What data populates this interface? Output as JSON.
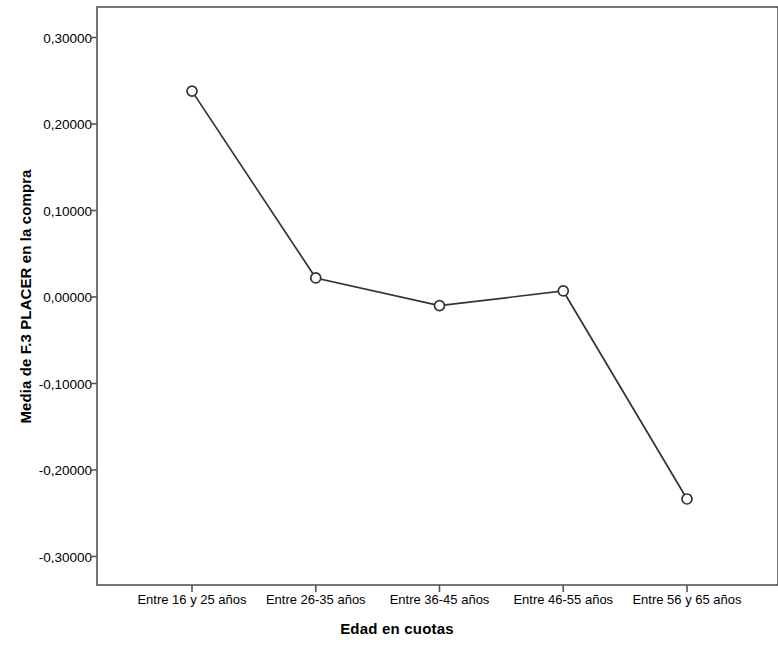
{
  "chart_data": {
    "type": "line",
    "title": "",
    "xlabel": "Edad en cuotas",
    "ylabel": "Media de F.3 PLACER en la compra",
    "categories": [
      "Entre 16 y 25 años",
      "Entre 26-35 años",
      "Entre 36-45 años",
      "Entre 46-55 años",
      "Entre 56 y 65 años"
    ],
    "values": [
      0.238,
      0.022,
      -0.01,
      0.007,
      -0.2335
    ],
    "ylim": [
      -0.33,
      0.33
    ],
    "yticks": [
      0.3,
      0.2,
      0.1,
      0.0,
      -0.1,
      -0.2,
      -0.3
    ],
    "ytick_labels": [
      "0,30000",
      "0,20000",
      "0,10000",
      "0,00000",
      "-0,10000",
      "-0,20000",
      "-0,30000"
    ],
    "grid": false,
    "legend": false,
    "marker": "open-circle",
    "line_color": "#333333",
    "frame_color": "#555555",
    "background": "#ffffff"
  }
}
